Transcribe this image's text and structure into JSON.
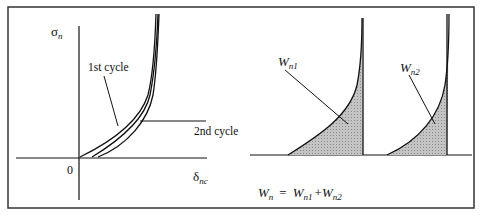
{
  "left_plot": {
    "y_axis_label": "σ",
    "y_axis_sub": "n",
    "x_axis_label": "δ",
    "x_axis_sub": "nc",
    "origin_label": "0",
    "curve_labels": [
      "1st cycle",
      "2nd cycle"
    ]
  },
  "right_plots": {
    "area1_label": "W",
    "area1_sub": "n1",
    "area2_label": "W",
    "area2_sub": "n2",
    "formula": {
      "lhs": "W",
      "lhs_sub": "n",
      "eq": "=",
      "t1": "W",
      "t1_sub": "n1",
      "plus": "+",
      "t2": "W",
      "t2_sub": "n2"
    }
  },
  "colors": {
    "line": "#111111",
    "shade": "#b8b8b8",
    "frame": "#333333"
  }
}
